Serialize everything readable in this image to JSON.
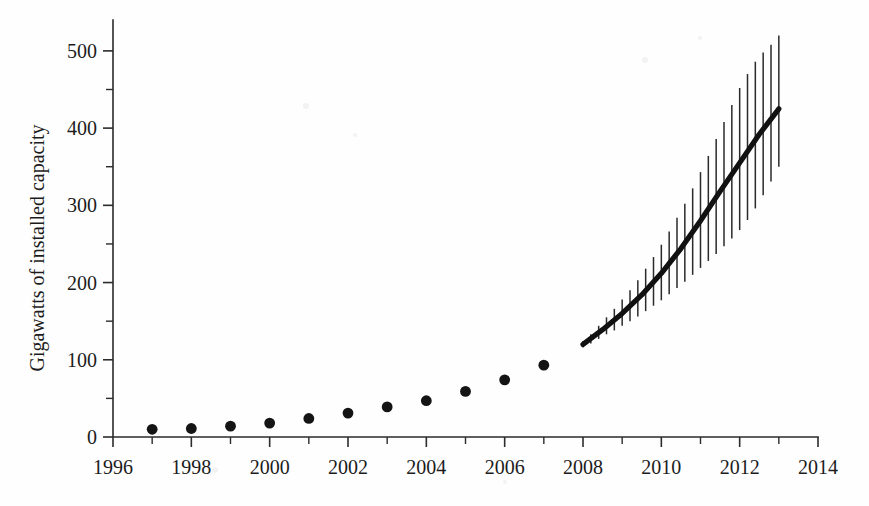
{
  "chart_data": {
    "type": "scatter",
    "title": "",
    "xlabel": "",
    "ylabel": "Gigawatts of installed capacity",
    "xlim": [
      1996,
      2014
    ],
    "ylim": [
      0,
      540
    ],
    "grid": false,
    "legend": null,
    "x_tick_labels": [
      "1996",
      "1998",
      "2000",
      "2002",
      "2004",
      "2006",
      "2008",
      "2010",
      "2012",
      "2014"
    ],
    "x_tick_values": [
      1996,
      1998,
      2000,
      2002,
      2004,
      2006,
      2008,
      2010,
      2012,
      2014
    ],
    "x_minor_tick_values": [
      1997,
      1999,
      2001,
      2003,
      2005,
      2007,
      2009,
      2011,
      2013
    ],
    "y_tick_labels": [
      "0",
      "100",
      "200",
      "300",
      "400",
      "500"
    ],
    "y_tick_values": [
      0,
      100,
      200,
      300,
      400,
      500
    ],
    "y_minor_tick_values": [
      50,
      150,
      250,
      350,
      450,
      550
    ],
    "series": [
      {
        "name": "Historical installed capacity",
        "type": "scatter",
        "marker": "filled-circle",
        "color": "#141414",
        "x": [
          1997,
          1998,
          1999,
          2000,
          2001,
          2002,
          2003,
          2004,
          2005,
          2006,
          2007
        ],
        "values": [
          10,
          11,
          14,
          18,
          24,
          31,
          39,
          47,
          59,
          74,
          93
        ]
      },
      {
        "name": "Projected installed capacity",
        "type": "line",
        "color": "#111111",
        "x": [
          2008,
          2008.5,
          2009,
          2009.5,
          2010,
          2010.5,
          2011,
          2011.5,
          2012,
          2012.5,
          2013
        ],
        "values": [
          120,
          139,
          160,
          184,
          212,
          244,
          280,
          318,
          355,
          392,
          425
        ]
      }
    ],
    "error_bars": {
      "description": "Vertical uncertainty bars drawn at regular sub-annual intervals along the projection, widening toward 2013",
      "x_start": 2008,
      "x_end": 2013,
      "x_step": 0.2,
      "points": [
        {
          "x": 2008.0,
          "y": 120,
          "low": 116,
          "high": 124
        },
        {
          "x": 2008.2,
          "y": 127,
          "low": 121,
          "high": 133
        },
        {
          "x": 2008.4,
          "y": 135,
          "low": 127,
          "high": 144
        },
        {
          "x": 2008.6,
          "y": 143,
          "low": 133,
          "high": 155
        },
        {
          "x": 2008.8,
          "y": 151,
          "low": 138,
          "high": 166
        },
        {
          "x": 2009.0,
          "y": 160,
          "low": 144,
          "high": 178
        },
        {
          "x": 2009.2,
          "y": 169,
          "low": 150,
          "high": 190
        },
        {
          "x": 2009.4,
          "y": 179,
          "low": 156,
          "high": 203
        },
        {
          "x": 2009.6,
          "y": 190,
          "low": 163,
          "high": 218
        },
        {
          "x": 2009.8,
          "y": 201,
          "low": 170,
          "high": 233
        },
        {
          "x": 2010.0,
          "y": 212,
          "low": 177,
          "high": 249
        },
        {
          "x": 2010.2,
          "y": 224,
          "low": 185,
          "high": 266
        },
        {
          "x": 2010.4,
          "y": 237,
          "low": 193,
          "high": 284
        },
        {
          "x": 2010.6,
          "y": 250,
          "low": 201,
          "high": 302
        },
        {
          "x": 2010.8,
          "y": 265,
          "low": 210,
          "high": 322
        },
        {
          "x": 2011.0,
          "y": 280,
          "low": 219,
          "high": 343
        },
        {
          "x": 2011.2,
          "y": 295,
          "low": 228,
          "high": 364
        },
        {
          "x": 2011.4,
          "y": 310,
          "low": 237,
          "high": 386
        },
        {
          "x": 2011.6,
          "y": 325,
          "low": 247,
          "high": 408
        },
        {
          "x": 2011.8,
          "y": 340,
          "low": 257,
          "high": 430
        },
        {
          "x": 2012.0,
          "y": 355,
          "low": 268,
          "high": 452
        },
        {
          "x": 2012.2,
          "y": 370,
          "low": 281,
          "high": 470
        },
        {
          "x": 2012.4,
          "y": 384,
          "low": 296,
          "high": 486
        },
        {
          "x": 2012.6,
          "y": 398,
          "low": 313,
          "high": 498
        },
        {
          "x": 2012.8,
          "y": 412,
          "low": 331,
          "high": 508
        },
        {
          "x": 2013.0,
          "y": 425,
          "low": 350,
          "high": 520
        }
      ]
    }
  },
  "figure": {
    "background_color": "#fefefe",
    "foreground_color": "#1c1c1c"
  }
}
